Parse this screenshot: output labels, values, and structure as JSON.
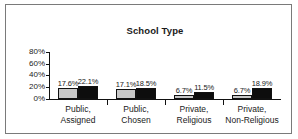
{
  "chart_data": {
    "type": "bar",
    "title": "School Type",
    "xlabel": "",
    "ylabel": "",
    "ylim": [
      0,
      80
    ],
    "ytick_labels": [
      "80%",
      "60%",
      "40%",
      "20%",
      "0%"
    ],
    "ytick_values": [
      80,
      60,
      40,
      20,
      0
    ],
    "grid": false,
    "legend": "none",
    "categories": [
      "Public, Assigned",
      "Public, Chosen",
      "Private, Religious",
      "Private, Non-Religious"
    ],
    "category_lines": [
      [
        "Public,",
        "Assigned"
      ],
      [
        "Public,",
        "Chosen"
      ],
      [
        "Private,",
        "Religious"
      ],
      [
        "Private,",
        "Non-Religious"
      ]
    ],
    "series": [
      {
        "name": "series-1",
        "color": "#c8c8c8",
        "values": [
          17.6,
          17.1,
          6.7,
          6.7
        ],
        "labels": [
          "17.6%",
          "17.1%",
          "6.7%",
          "6.7%"
        ]
      },
      {
        "name": "series-2",
        "color": "#0d0d0d",
        "values": [
          22.1,
          18.5,
          11.5,
          18.9
        ],
        "labels": [
          "22.1%",
          "18.5%",
          "11.5%",
          "18.9%"
        ]
      }
    ]
  }
}
